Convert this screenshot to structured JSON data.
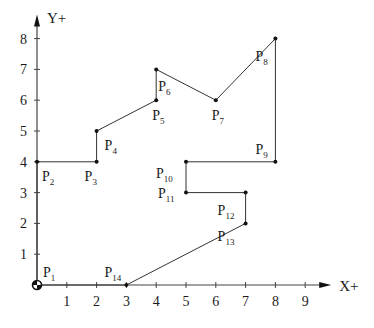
{
  "chart_data": {
    "type": "line",
    "title": "",
    "xlabel": "X+",
    "ylabel": "Y+",
    "xlim": [
      0,
      9
    ],
    "ylim": [
      0,
      8
    ],
    "x_ticks": [
      "1",
      "2",
      "3",
      "4",
      "5",
      "6",
      "7",
      "8",
      "9"
    ],
    "y_ticks": [
      "1",
      "2",
      "3",
      "4",
      "5",
      "6",
      "7",
      "8"
    ],
    "grid": false,
    "closed_polygon": true,
    "points": [
      {
        "name": "P",
        "sub": "1",
        "x": 0,
        "y": 0,
        "label_pos": "above-right"
      },
      {
        "name": "P",
        "sub": "2",
        "x": 0,
        "y": 4,
        "label_pos": "below-right"
      },
      {
        "name": "P",
        "sub": "3",
        "x": 2,
        "y": 4,
        "label_pos": "below-left"
      },
      {
        "name": "P",
        "sub": "4",
        "x": 2,
        "y": 5,
        "label_pos": "below-right"
      },
      {
        "name": "P",
        "sub": "5",
        "x": 4,
        "y": 6,
        "label_pos": "below"
      },
      {
        "name": "P",
        "sub": "6",
        "x": 4,
        "y": 7,
        "label_pos": "below-right"
      },
      {
        "name": "P",
        "sub": "7",
        "x": 6,
        "y": 6,
        "label_pos": "below"
      },
      {
        "name": "P",
        "sub": "8",
        "x": 8,
        "y": 8,
        "label_pos": "below-left"
      },
      {
        "name": "P",
        "sub": "9",
        "x": 8,
        "y": 4,
        "label_pos": "above-left"
      },
      {
        "name": "P",
        "sub": "10",
        "x": 5,
        "y": 4,
        "label_pos": "below-left"
      },
      {
        "name": "P",
        "sub": "11",
        "x": 5,
        "y": 3,
        "label_pos": "left"
      },
      {
        "name": "P",
        "sub": "12",
        "x": 7,
        "y": 3,
        "label_pos": "below-left"
      },
      {
        "name": "P",
        "sub": "13",
        "x": 7,
        "y": 2,
        "label_pos": "left"
      },
      {
        "name": "P",
        "sub": "14",
        "x": 3,
        "y": 0,
        "label_pos": "above-left"
      }
    ]
  },
  "colors": {
    "line": "#333333",
    "point": "#111111",
    "axis": "#444444"
  }
}
